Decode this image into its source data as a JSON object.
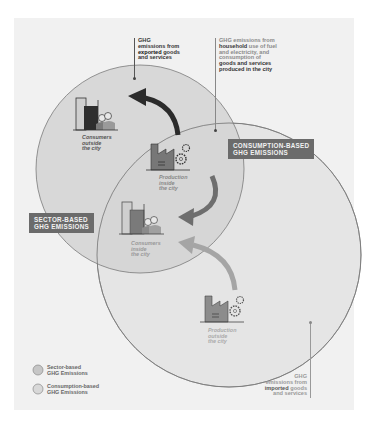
{
  "diagram": {
    "labels": {
      "sector_based": [
        "SECTOR-BASED",
        "GHG EMISSIONS"
      ],
      "consumption_based": [
        "CONSUMPTION-BASED",
        "GHG EMISSIONS"
      ]
    },
    "notes": {
      "exported": {
        "line1": "GHG",
        "line2": "emissions from",
        "line3_bold": "exported",
        "line3_rest": " goods",
        "line4": "and services"
      },
      "household": {
        "line1": "GHG emissions from",
        "line2_bold": "household",
        "line2_rest": " use of fuel",
        "line3": "and electricity, and",
        "line4": "consumption of",
        "line5_bold": "goods and services",
        "line6_bold": "produced in the city"
      },
      "imported": {
        "line1": "GHG",
        "line2": "emissions from",
        "line3_bold": "imported",
        "line3_rest": " goods",
        "line4": "and services"
      }
    },
    "captions": {
      "consumers_outside": [
        "Consumers",
        "outside",
        "the city"
      ],
      "production_inside": [
        "Production",
        "inside",
        "the city"
      ],
      "consumers_inside": [
        "Consumers",
        "inside",
        "the city"
      ],
      "production_outside": [
        "Production",
        "outside",
        "the city"
      ]
    },
    "legend": [
      {
        "line1": "Sector-based",
        "line2": "GHG Emissions"
      },
      {
        "line1": "Consumption-based",
        "line2": "GHG Emissions"
      }
    ],
    "colors": {
      "background_panel": "#f1f1f1",
      "sector_circle_fill": "#d6d6d6",
      "consumption_circle_fill": "#e4e4e4",
      "label_box": "#6b6b6b",
      "arrow_export": "#2b2b2b",
      "arrow_internal": "#6e6e6e",
      "arrow_import": "#a5a5a5"
    }
  }
}
